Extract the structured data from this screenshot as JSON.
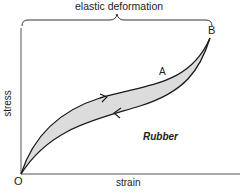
{
  "diagram": {
    "title": "elastic deformation",
    "x_axis_label": "strain",
    "y_axis_label": "stress",
    "origin_label": "O",
    "point_b_label": "B",
    "point_a_label": "A",
    "material_label": "Rubber",
    "colors": {
      "line": "#1a1a1a",
      "fill": "#dcdcdc",
      "axis": "#444444"
    }
  }
}
